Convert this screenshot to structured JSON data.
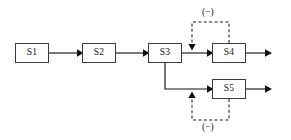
{
  "diagram": {
    "background_color": "#ffffff",
    "line_color": "#151515",
    "box_border_color": "#3a3a3a",
    "box_fill_color": "#fdfdfd",
    "nodes": [
      {
        "id": "s1",
        "label": "S1",
        "x": 15,
        "y": 43,
        "w": 34,
        "h": 20
      },
      {
        "id": "s2",
        "label": "S2",
        "x": 82,
        "y": 43,
        "w": 34,
        "h": 20
      },
      {
        "id": "s3",
        "label": "S3",
        "x": 148,
        "y": 43,
        "w": 34,
        "h": 20
      },
      {
        "id": "s4",
        "label": "S4",
        "x": 212,
        "y": 43,
        "w": 34,
        "h": 20
      },
      {
        "id": "s5",
        "label": "S5",
        "x": 212,
        "y": 79,
        "w": 34,
        "h": 20
      }
    ],
    "connections": [
      {
        "id": "s1-to-s2",
        "from": "s1",
        "to": "s2",
        "style": "solid",
        "arrow": "right"
      },
      {
        "id": "s2-to-s3",
        "from": "s2",
        "to": "s3",
        "style": "solid",
        "arrow": "right"
      },
      {
        "id": "s3-to-s4",
        "from": "s3",
        "to": "s4",
        "style": "solid",
        "arrow": "right"
      },
      {
        "id": "s3-branch-to-s5",
        "from": "s3",
        "to": "s5",
        "style": "solid",
        "arrow": "right"
      },
      {
        "id": "s4-output",
        "from": "s4",
        "to": "output-top",
        "style": "solid",
        "arrow": "right"
      },
      {
        "id": "s5-output",
        "from": "s5",
        "to": "output-bottom",
        "style": "solid",
        "arrow": "right"
      }
    ],
    "feedback_loops": [
      {
        "id": "s4-feedback",
        "source": "s4",
        "target": "s3-to-s4-link",
        "style": "dashed",
        "arrow": "down",
        "routing": "above",
        "sign_label": "(−)"
      },
      {
        "id": "s5-feedback",
        "source": "s5",
        "target": "s3-to-s5-link",
        "style": "dashed",
        "arrow": "up",
        "routing": "below",
        "sign_label": "(−)"
      }
    ]
  }
}
